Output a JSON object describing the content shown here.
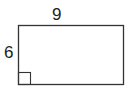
{
  "diagram": {
    "type": "rectangle",
    "labels": {
      "width": "9",
      "height": "6"
    },
    "right_angle_marker": "bottom-left",
    "colors": {
      "stroke": "#333333",
      "background": "#ffffff",
      "text": "#222222"
    }
  }
}
